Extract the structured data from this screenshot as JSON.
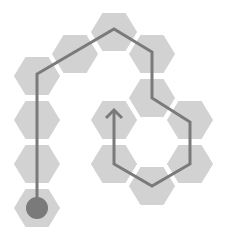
{
  "diagram": {
    "title": "",
    "hex_size": 24,
    "colors": {
      "hex_fill": "#d2d2d2",
      "hex_gap": "#ffffff",
      "path_stroke": "#7a7a7a",
      "start_marker": "#7a7a7a",
      "background": "#ffffff"
    },
    "hexes": [
      {
        "id": "h1",
        "cx": 37,
        "cy": 208
      },
      {
        "id": "h2",
        "cx": 37,
        "cy": 164
      },
      {
        "id": "h3",
        "cx": 37,
        "cy": 120
      },
      {
        "id": "h4",
        "cx": 37,
        "cy": 76
      },
      {
        "id": "h5",
        "cx": 75,
        "cy": 54
      },
      {
        "id": "h6",
        "cx": 114,
        "cy": 32
      },
      {
        "id": "h7",
        "cx": 152,
        "cy": 54
      },
      {
        "id": "h8",
        "cx": 152,
        "cy": 98
      },
      {
        "id": "h9",
        "cx": 190,
        "cy": 120
      },
      {
        "id": "h10",
        "cx": 190,
        "cy": 164
      },
      {
        "id": "h11",
        "cx": 152,
        "cy": 186
      },
      {
        "id": "h12",
        "cx": 114,
        "cy": 164
      },
      {
        "id": "h13",
        "cx": 114,
        "cy": 120
      }
    ],
    "path": {
      "points": [
        [
          37,
          208
        ],
        [
          37,
          74
        ],
        [
          114,
          29
        ],
        [
          152,
          52
        ],
        [
          152,
          98
        ],
        [
          190,
          122
        ],
        [
          190,
          164
        ],
        [
          152,
          186
        ],
        [
          114,
          164
        ],
        [
          114,
          110
        ]
      ],
      "arrow_tip": [
        114,
        110
      ]
    },
    "start_marker": {
      "cx": 37,
      "cy": 208,
      "r": 11
    }
  }
}
